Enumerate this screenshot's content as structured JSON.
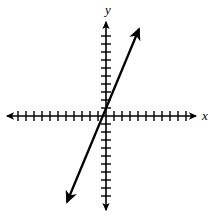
{
  "figure": {
    "width": 217,
    "height": 216,
    "background": "#ffffff",
    "stroke_color": "#000000"
  },
  "axes": {
    "x_axis": {
      "label": "x",
      "label_position": {
        "x": 205,
        "y": 120
      },
      "orientation": "horizontal",
      "y_pixel": 116,
      "start_x": 7,
      "end_x": 196,
      "arrow_both_ends": true,
      "tick_count_negative": 11,
      "tick_count_positive": 11,
      "tick_spacing_px": 8,
      "tick_half_length_px": 5,
      "range": [
        -11,
        11
      ]
    },
    "y_axis": {
      "label": "y",
      "label_position": {
        "x": 108,
        "y": 14
      },
      "orientation": "vertical",
      "x_pixel": 106,
      "start_y": 22,
      "end_y": 210,
      "arrow_both_ends": true,
      "tick_count_positive": 10,
      "tick_count_negative": 10,
      "tick_spacing_px": 8,
      "tick_half_length_px": 5,
      "range": [
        -10,
        10
      ]
    },
    "origin": {
      "x": 106,
      "y": 116
    }
  },
  "chart_data": {
    "type": "line",
    "title": "",
    "xlabel": "x",
    "ylabel": "y",
    "xlim": [
      -11,
      11
    ],
    "ylim": [
      -10,
      10
    ],
    "grid": false,
    "legend": null,
    "series": [
      {
        "name": "line",
        "slope": 2.5,
        "intercept": 0,
        "passes_through_origin": true,
        "arrow_start": true,
        "arrow_end": true,
        "endpoint_pixels": {
          "lower_left": {
            "x": 67,
            "y": 202
          },
          "upper_right": {
            "x": 139,
            "y": 29
          }
        },
        "points": [
          {
            "x": -4.8,
            "y": -10.7
          },
          {
            "x": 0,
            "y": 0
          },
          {
            "x": 4.1,
            "y": 10.9
          }
        ]
      }
    ]
  }
}
